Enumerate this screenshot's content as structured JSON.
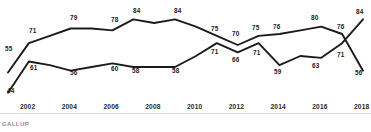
{
  "source_note": "GALLUP",
  "chart_data": {
    "type": "line",
    "title": "",
    "subtitle": "",
    "xlabel": "",
    "ylabel": "",
    "grid": false,
    "legend": "none",
    "xlim": [
      2001,
      2018
    ],
    "ylim": [
      40,
      88
    ],
    "x": [
      2001,
      2002,
      2003,
      2004,
      2005,
      2006,
      2007,
      2008,
      2009,
      2010,
      2011,
      2012,
      2013,
      2014,
      2015,
      2016,
      2017,
      2018
    ],
    "tick_labels": [
      "2002",
      "2004",
      "2006",
      "2008",
      "2010",
      "2012",
      "2014",
      "2016",
      "2018"
    ],
    "tick_years": [
      2002,
      2004,
      2006,
      2008,
      2010,
      2012,
      2014,
      2016,
      2018
    ],
    "series": [
      {
        "name": "upper-line",
        "values": [
          55,
          71,
          75,
          79,
          79,
          78,
          84,
          82,
          84,
          80,
          75,
          70,
          75,
          76,
          78,
          80,
          76,
          56
        ],
        "labels": [
          {
            "year": 2001,
            "value": 55,
            "text": "55",
            "x": 5,
            "y": 46
          },
          {
            "year": 2002,
            "value": 71,
            "text": "71",
            "x": 29,
            "y": 28
          },
          {
            "year": 2004,
            "value": 79,
            "text": "79",
            "x": 70,
            "y": 15
          },
          {
            "year": 2006,
            "value": 78,
            "text": "78",
            "x": 111,
            "y": 17
          },
          {
            "year": 2007,
            "value": 84,
            "text": "84",
            "x": 133,
            "y": 8
          },
          {
            "year": 2009,
            "value": 84,
            "text": "84",
            "x": 174,
            "y": 8
          },
          {
            "year": 2011,
            "value": 75,
            "text": "75",
            "x": 211,
            "y": 26
          },
          {
            "year": 2012,
            "value": 70,
            "text": "70",
            "x": 232,
            "y": 31
          },
          {
            "year": 2013,
            "value": 75,
            "text": "75",
            "x": 252,
            "y": 25
          },
          {
            "year": 2014,
            "value": 76,
            "text": "76",
            "x": 273,
            "y": 24
          },
          {
            "year": 2016,
            "value": 80,
            "text": "80",
            "x": 311,
            "y": 15
          },
          {
            "year": 2017,
            "value": 76,
            "text": "76",
            "x": 337,
            "y": 24
          },
          {
            "year": 2018,
            "value": 56,
            "text": "56",
            "x": 355,
            "y": 70
          }
        ]
      },
      {
        "name": "lower-line",
        "values": [
          44,
          61,
          59,
          56,
          58,
          60,
          58,
          58,
          58,
          64,
          71,
          66,
          71,
          59,
          64,
          63,
          71,
          84
        ],
        "labels": [
          {
            "year": 2001,
            "value": 44,
            "text": "44",
            "x": 7,
            "y": 88
          },
          {
            "year": 2002,
            "value": 61,
            "text": "61",
            "x": 30,
            "y": 65
          },
          {
            "year": 2004,
            "value": 56,
            "text": "56",
            "x": 70,
            "y": 70
          },
          {
            "year": 2006,
            "value": 60,
            "text": "60",
            "x": 111,
            "y": 66
          },
          {
            "year": 2007,
            "value": 58,
            "text": "58",
            "x": 132,
            "y": 68
          },
          {
            "year": 2009,
            "value": 58,
            "text": "58",
            "x": 172,
            "y": 68
          },
          {
            "year": 2011,
            "value": 71,
            "text": "71",
            "x": 211,
            "y": 49
          },
          {
            "year": 2012,
            "value": 66,
            "text": "66",
            "x": 232,
            "y": 57
          },
          {
            "year": 2013,
            "value": 71,
            "text": "71",
            "x": 253,
            "y": 50
          },
          {
            "year": 2014,
            "value": 59,
            "text": "59",
            "x": 274,
            "y": 69
          },
          {
            "year": 2016,
            "value": 63,
            "text": "63",
            "x": 312,
            "y": 63
          },
          {
            "year": 2017,
            "value": 71,
            "text": "71",
            "x": 337,
            "y": 52
          },
          {
            "year": 2018,
            "value": 84,
            "text": "84",
            "x": 356,
            "y": 9
          }
        ]
      }
    ]
  }
}
